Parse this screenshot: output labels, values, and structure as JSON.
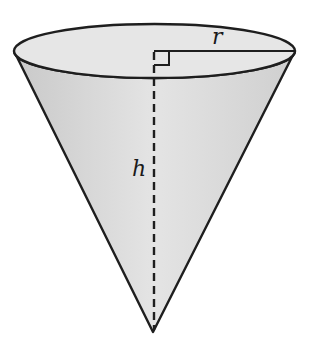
{
  "diagram": {
    "type": "cone",
    "orientation": "inverted",
    "labels": {
      "radius": "r",
      "height": "h"
    },
    "colors": {
      "fill": "#d9d9d9",
      "top_fill": "#e2e2e2",
      "stroke": "#1e1e1e",
      "background": "#ffffff"
    },
    "annotations": {
      "right_angle_marker": true,
      "height_line_style": "dashed",
      "radius_line_style": "solid"
    }
  }
}
